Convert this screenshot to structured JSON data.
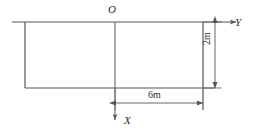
{
  "figure": {
    "type": "engineering-coordinate-diagram",
    "background_color": "#ffffff",
    "line_color": "#555555",
    "text_color": "#2b2b2b"
  },
  "labels": {
    "origin": "O",
    "y_axis": "Y",
    "x_axis": "X",
    "horizontal_dimension": "6m",
    "vertical_dimension": "2m"
  },
  "geometry": {
    "origin_point": {
      "x": 115,
      "y": 22
    },
    "y_axis": {
      "x_start": 12,
      "x_end": 240,
      "y": 22,
      "direction": "right"
    },
    "x_axis": {
      "x": 115,
      "y_start": 22,
      "y_end": 124,
      "direction": "down"
    },
    "rectangle": {
      "left": 25,
      "top": 22,
      "right": 203,
      "bottom": 88
    },
    "horizontal_dimension_line": {
      "x_start": 115,
      "x_end": 203,
      "y": 103
    },
    "vertical_dimension_line": {
      "x": 215,
      "y_start": 22,
      "y_end": 88
    }
  }
}
